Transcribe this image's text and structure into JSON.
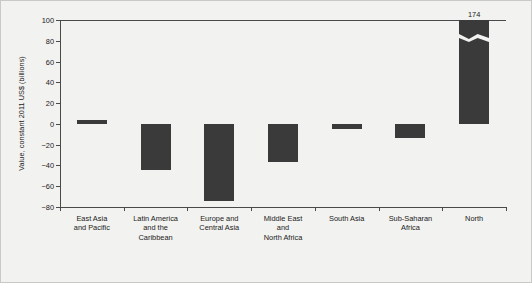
{
  "chart_data": {
    "type": "bar",
    "title": "",
    "xlabel": "",
    "ylabel": "Value, constant 2011 US$ (billions)",
    "categories": [
      "East Asia\nand Pacific",
      "Latin America\nand the\nCaribbean",
      "Europe and\nCentral Asia",
      "Middle East\nand\nNorth Africa",
      "South Asia",
      "Sub-Saharan\nAfrica",
      "North"
    ],
    "values": [
      4,
      -44,
      -74,
      -37,
      -5,
      -14,
      174
    ],
    "ylim": [
      -80,
      100
    ],
    "yticks": [
      100,
      80,
      60,
      40,
      20,
      0,
      -20,
      -40,
      -60,
      -80
    ],
    "ytick_labels": [
      "100",
      "80",
      "60",
      "40",
      "20",
      "0",
      "−20",
      "−40",
      "−60",
      "−80"
    ],
    "grid": false,
    "legend": null,
    "annotations": [
      {
        "category": "North",
        "label": "174",
        "note": "bar is truncated with an axis-break zigzag; actual value exceeds axis maximum"
      }
    ],
    "bar_color": "#3a3a3a",
    "axis_color": "#4a4a4a",
    "background_color": "#f2f2f0"
  }
}
